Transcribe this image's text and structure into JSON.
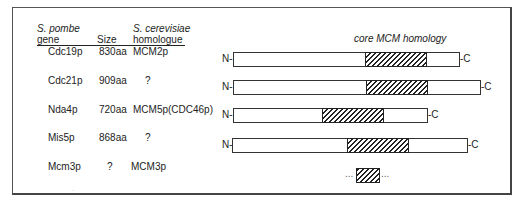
{
  "table": {
    "headers": {
      "gene": {
        "line1": "S. pombe",
        "line2": "gene"
      },
      "size": "Size",
      "homologue": {
        "line1": "S. cerevisiae",
        "line2": "homologue"
      }
    },
    "rows": [
      {
        "gene": "Cdc19p",
        "size": "830aa",
        "homologue": "MCM2p"
      },
      {
        "gene": "Cdc21p",
        "size": "909aa",
        "homologue": "?"
      },
      {
        "gene": "Nda4p",
        "size": "720aa",
        "homologue": "MCM5p(CDC46p)"
      },
      {
        "gene": "Mis5p",
        "size": "868aa",
        "homologue": "?"
      },
      {
        "gene": "Mcm3p",
        "size": "?",
        "homologue": "MCM3p"
      }
    ]
  },
  "diagram": {
    "title": "core MCM homology",
    "n_label": "N-",
    "c_label": "-C",
    "ellipsis": "...",
    "bars": [
      {
        "gene": "Cdc19p",
        "left": 233,
        "right": 460,
        "hatch_start": 365,
        "hatch_end": 426,
        "top": 52
      },
      {
        "gene": "Cdc21p",
        "left": 233,
        "right": 481,
        "hatch_start": 366,
        "hatch_end": 427,
        "top": 80
      },
      {
        "gene": "Nda4p",
        "left": 233,
        "right": 428,
        "hatch_start": 322,
        "hatch_end": 383,
        "top": 108
      },
      {
        "gene": "Mis5p",
        "left": 232,
        "right": 468,
        "hatch_start": 347,
        "hatch_end": 408,
        "top": 138
      },
      {
        "gene": "Mcm3p",
        "partial": true,
        "hatch_start": 356,
        "hatch_end": 379,
        "top": 168
      }
    ]
  }
}
